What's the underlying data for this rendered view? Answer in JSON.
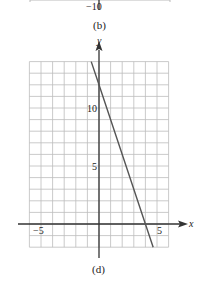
{
  "top_fragment": {
    "tick_label": "−10",
    "caption": "(b)"
  },
  "caption": "(d)",
  "chart_data": {
    "type": "line",
    "title": "",
    "xlabel": "x",
    "ylabel": "y",
    "xlim": [
      -6,
      6
    ],
    "ylim": [
      -2,
      14
    ],
    "grid": true,
    "x_ticks": [
      -5,
      5
    ],
    "y_ticks": [
      5,
      10
    ],
    "series": [
      {
        "name": "line",
        "equation": "y = -3x + 12",
        "x": [
          -0.67,
          0,
          4,
          4.67
        ],
        "y": [
          14,
          12,
          0,
          -2
        ]
      }
    ]
  },
  "labels": {
    "x_axis": "x",
    "y_axis": "y",
    "x_neg5": "−5",
    "x_pos5": "5",
    "y_5": "5",
    "y_10": "10"
  }
}
